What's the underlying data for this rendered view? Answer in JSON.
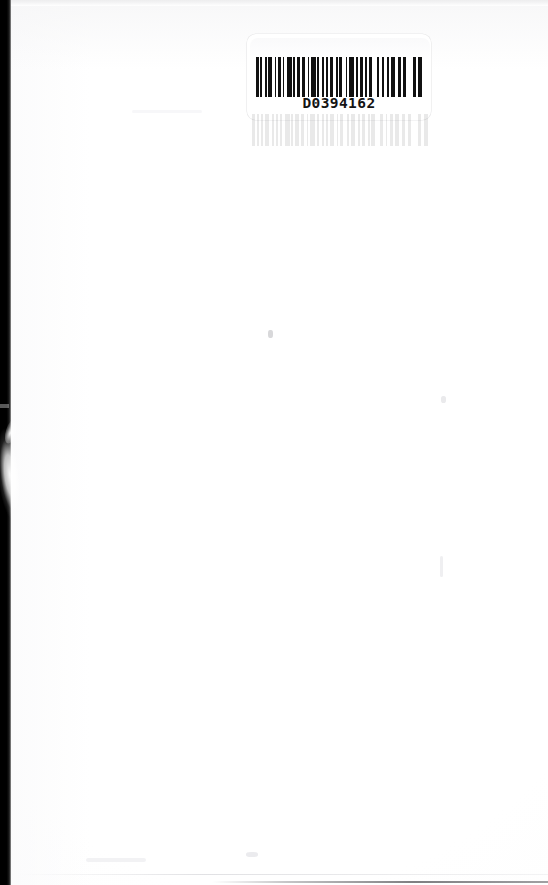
{
  "document": {
    "type": "scanned-page",
    "page_background": "#ffffff",
    "page_width": 548,
    "page_height": 885,
    "content_description": "blank scanned book page with an adhesive barcode label near the top center"
  },
  "label": {
    "name": "barcode-label",
    "barcode_number": "D0394162",
    "symbology": "code-39",
    "ink_color": "#111111",
    "label_color": "#ffffff",
    "bars": [
      {
        "w": 3,
        "dark": true
      },
      {
        "w": 2,
        "dark": false
      },
      {
        "w": 2,
        "dark": true
      },
      {
        "w": 3,
        "dark": false
      },
      {
        "w": 2,
        "dark": true
      },
      {
        "w": 2,
        "dark": false
      },
      {
        "w": 4,
        "dark": true
      },
      {
        "w": 3,
        "dark": false
      },
      {
        "w": 2,
        "dark": true
      },
      {
        "w": 2,
        "dark": false
      },
      {
        "w": 3,
        "dark": true
      },
      {
        "w": 2,
        "dark": false
      },
      {
        "w": 2,
        "dark": true
      },
      {
        "w": 3,
        "dark": false
      },
      {
        "w": 5,
        "dark": true
      },
      {
        "w": 2,
        "dark": false
      },
      {
        "w": 2,
        "dark": true
      },
      {
        "w": 2,
        "dark": false
      },
      {
        "w": 4,
        "dark": true
      },
      {
        "w": 2,
        "dark": false
      },
      {
        "w": 3,
        "dark": true
      },
      {
        "w": 3,
        "dark": false
      },
      {
        "w": 2,
        "dark": true
      },
      {
        "w": 2,
        "dark": false
      },
      {
        "w": 5,
        "dark": true
      },
      {
        "w": 2,
        "dark": false
      },
      {
        "w": 2,
        "dark": true
      },
      {
        "w": 3,
        "dark": false
      },
      {
        "w": 3,
        "dark": true
      },
      {
        "w": 2,
        "dark": false
      },
      {
        "w": 2,
        "dark": true
      },
      {
        "w": 2,
        "dark": false
      },
      {
        "w": 4,
        "dark": true
      },
      {
        "w": 3,
        "dark": false
      },
      {
        "w": 2,
        "dark": true
      },
      {
        "w": 2,
        "dark": false
      },
      {
        "w": 3,
        "dark": true
      },
      {
        "w": 4,
        "dark": false
      },
      {
        "w": 2,
        "dark": true
      },
      {
        "w": 2,
        "dark": false
      },
      {
        "w": 5,
        "dark": true
      },
      {
        "w": 3,
        "dark": false
      },
      {
        "w": 2,
        "dark": true
      },
      {
        "w": 2,
        "dark": false
      },
      {
        "w": 3,
        "dark": true
      },
      {
        "w": 3,
        "dark": false
      },
      {
        "w": 2,
        "dark": true
      },
      {
        "w": 2,
        "dark": false
      },
      {
        "w": 4,
        "dark": true
      },
      {
        "w": 5,
        "dark": false
      },
      {
        "w": 3,
        "dark": true
      },
      {
        "w": 3,
        "dark": false
      },
      {
        "w": 2,
        "dark": true
      },
      {
        "w": 3,
        "dark": false
      },
      {
        "w": 3,
        "dark": true
      },
      {
        "w": 2,
        "dark": false
      },
      {
        "w": 4,
        "dark": true
      },
      {
        "w": 4,
        "dark": false
      },
      {
        "w": 3,
        "dark": true
      },
      {
        "w": 3,
        "dark": false
      },
      {
        "w": 3,
        "dark": true
      },
      {
        "w": 8,
        "dark": false
      },
      {
        "w": 3,
        "dark": true
      },
      {
        "w": 3,
        "dark": false
      },
      {
        "w": 4,
        "dark": true
      }
    ]
  },
  "scan_artifacts": {
    "left_edge_color": "#000000",
    "left_edge_label": "scanner-dark-edge",
    "top_edge_label": "scanner-top-shadow",
    "bottom_edge_label": "scanner-bottom-line",
    "streak_label": "scanner-light-streak"
  }
}
